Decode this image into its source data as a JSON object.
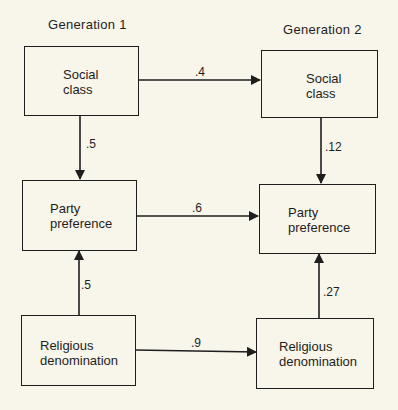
{
  "headers": {
    "gen1": "Generation 1",
    "gen2": "Generation 2"
  },
  "nodes": {
    "g1_social": {
      "line1": "Social",
      "line2": "class"
    },
    "g2_social": {
      "line1": "Social",
      "line2": "class"
    },
    "g1_party": {
      "line1": "Party",
      "line2": "preference"
    },
    "g2_party": {
      "line1": "Party",
      "line2": "preference"
    },
    "g1_religion": {
      "line1": "Religious",
      "line2": "denomination"
    },
    "g2_religion": {
      "line1": "Religious",
      "line2": "denomination"
    }
  },
  "edges": {
    "social_g1_g2": ".4",
    "social_to_party_g1": ".5",
    "social_to_party_g2": ".12",
    "party_g1_g2": ".6",
    "religion_to_party_g1": ".5",
    "religion_to_party_g2": ".27",
    "religion_g1_g2": ".9"
  }
}
